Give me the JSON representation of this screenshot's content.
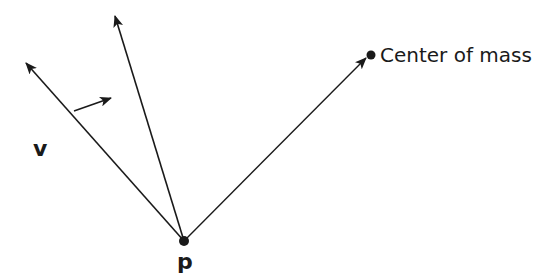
{
  "diagram": {
    "labels": {
      "point": "p",
      "velocity": "v",
      "center_of_mass": "Center of mass"
    },
    "colors": {
      "stroke": "#1a1a1a",
      "background": "#ffffff"
    },
    "points": {
      "p": [
        184,
        241
      ],
      "left_arrow_tip": [
        26,
        63
      ],
      "middle_arrow_tip": [
        115,
        16
      ],
      "center_of_mass": [
        371,
        55
      ],
      "small_arrow": {
        "from": [
          74,
          111
        ],
        "to": [
          111,
          98
        ]
      }
    }
  }
}
